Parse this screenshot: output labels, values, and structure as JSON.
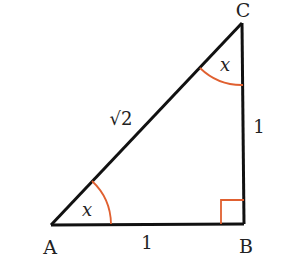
{
  "diagram": {
    "type": "right-triangle",
    "vertices": {
      "A": {
        "label": "A",
        "x": 51,
        "y": 225
      },
      "B": {
        "label": "B",
        "x": 244,
        "y": 224
      },
      "C": {
        "label": "C",
        "x": 242,
        "y": 23
      }
    },
    "sides": {
      "AB": {
        "label": "1"
      },
      "BC": {
        "label": "1"
      },
      "AC": {
        "label": "√2"
      }
    },
    "angles": {
      "A": {
        "label": "x"
      },
      "C": {
        "label": "x"
      },
      "B": {
        "right_angle": true
      }
    },
    "colors": {
      "line": "#111111",
      "angle_mark": "#e06030"
    }
  }
}
